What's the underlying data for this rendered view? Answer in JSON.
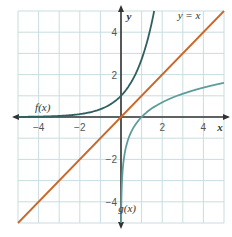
{
  "chart_data": {
    "type": "line",
    "title": "",
    "xlabel": "x",
    "ylabel": "y",
    "xlim": [
      -5,
      5
    ],
    "ylim": [
      -5,
      5
    ],
    "grid": true,
    "x_ticks": [
      -4,
      -2,
      2,
      4
    ],
    "y_ticks": [
      4,
      2,
      -2,
      -4
    ],
    "x_tick_labels": [
      "−4",
      "−2",
      "2",
      "4"
    ],
    "y_tick_labels": [
      "4",
      "2",
      "−2",
      "−4"
    ],
    "series": [
      {
        "name": "f(x)",
        "label": "f(x)",
        "function": "e^x",
        "color": "#2f5f5f",
        "x": [
          -5,
          -4,
          -3,
          -2,
          -1,
          0,
          0.5,
          1,
          1.5,
          1.6
        ],
        "y": [
          0.007,
          0.018,
          0.05,
          0.135,
          0.368,
          1,
          1.649,
          2.718,
          4.482,
          4.953
        ]
      },
      {
        "name": "g(x)",
        "label": "g(x)",
        "function": "ln x",
        "color": "#5e9c9c",
        "x": [
          0.007,
          0.018,
          0.05,
          0.135,
          0.368,
          1,
          2,
          3,
          4,
          5
        ],
        "y": [
          -4.96,
          -4.0,
          -3.0,
          -2.0,
          -1.0,
          0,
          0.693,
          1.099,
          1.386,
          1.609
        ]
      },
      {
        "name": "y = x",
        "label": "y = x",
        "function": "x",
        "color": "#c8682a",
        "x": [
          -5,
          5
        ],
        "y": [
          -5,
          5
        ]
      }
    ],
    "annotations": [
      {
        "text": "f(x)",
        "x": -3.8,
        "y": 0.3
      },
      {
        "text": "g(x)",
        "x": 0.3,
        "y": -4.5
      },
      {
        "text": "y = x",
        "x": 3.3,
        "y": 4.6
      }
    ],
    "legend_position": "none"
  },
  "layout": {
    "grid_color": "#c9dde0",
    "axis_color": "#333333"
  }
}
